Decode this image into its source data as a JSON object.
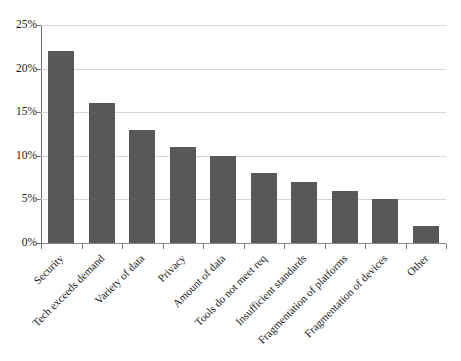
{
  "chart_data": {
    "type": "bar",
    "title": "",
    "subtitle": "",
    "xlabel": "",
    "ylabel": "",
    "categories": [
      "Security",
      "Tech exceeds demand",
      "Variety of data",
      "Privacy",
      "Amount of data",
      "Tools do not meet req",
      "Insufficient standards",
      "Fragmentation of platforms",
      "Fragmentation of devices",
      "Other"
    ],
    "values": [
      22,
      16,
      13,
      11,
      10,
      8,
      7,
      6,
      5,
      2
    ],
    "value_unit": "%",
    "ylim": [
      0,
      25
    ],
    "ytick_values": [
      0,
      5,
      10,
      15,
      20,
      25
    ],
    "ytick_labels": [
      "0%",
      "5%",
      "10%",
      "15%",
      "20%",
      "25%"
    ],
    "grid": true,
    "grid_axis": "y",
    "legend": false,
    "legend_position": "none",
    "series": [
      {
        "name": "",
        "values": [
          22,
          16,
          13,
          11,
          10,
          8,
          7,
          6,
          5,
          2
        ]
      }
    ],
    "colors": {
      "bar_fill": "#58585A",
      "gridline": "#D6D6D6",
      "axis_line": "#6E6E6E",
      "background": "#FFFFFF",
      "text": "#1A1A1A"
    },
    "xtick_label_rotation": -45
  }
}
